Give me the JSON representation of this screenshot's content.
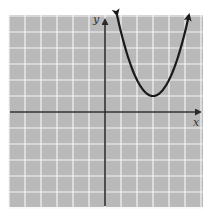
{
  "chart_data": {
    "type": "line",
    "title": "",
    "xlabel": "x",
    "ylabel": "y",
    "grid": true,
    "xlim": [
      -6,
      6
    ],
    "ylim": [
      -6,
      6
    ],
    "tick_labels_shown": false,
    "series": [
      {
        "name": "parabola",
        "function": "y = (x - 3)^2 + 1",
        "vertex": [
          3,
          1
        ],
        "x": [
          0.75,
          1,
          1.5,
          2,
          2.5,
          3,
          3.5,
          4,
          4.5,
          5,
          5.25
        ],
        "y": [
          6.06,
          5,
          3.25,
          2,
          1.25,
          1,
          1.25,
          2,
          3.25,
          5,
          6.06
        ],
        "arrows_at_ends": true
      }
    ]
  },
  "labels": {
    "x_axis": "x",
    "y_axis": "y"
  },
  "colors": {
    "background": "#b9b9b9",
    "grid": "#f4f4f4",
    "axis": "#2a2a2a",
    "curve": "#1a1a1a"
  }
}
